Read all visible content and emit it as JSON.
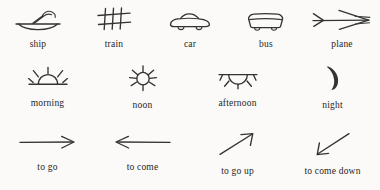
{
  "page": {
    "background_color": "#fbfaf8",
    "ink_color": "#333333"
  },
  "rows": [
    {
      "name": "transport",
      "items": [
        {
          "icon": "ship-icon",
          "label": "ship"
        },
        {
          "icon": "train-icon",
          "label": "train"
        },
        {
          "icon": "car-icon",
          "label": "car"
        },
        {
          "icon": "bus-icon",
          "label": "bus"
        },
        {
          "icon": "plane-icon",
          "label": "plane"
        }
      ]
    },
    {
      "name": "time-of-day",
      "items": [
        {
          "icon": "sunrise-icon",
          "label": "morning"
        },
        {
          "icon": "sun-icon",
          "label": "noon"
        },
        {
          "icon": "sunset-icon",
          "label": "afternoon"
        },
        {
          "icon": "crescent-moon-icon",
          "label": "night"
        }
      ]
    },
    {
      "name": "motion",
      "items": [
        {
          "icon": "arrow-right-icon",
          "label": "to go"
        },
        {
          "icon": "arrow-left-icon",
          "label": "to come"
        },
        {
          "icon": "arrow-up-right-icon",
          "label": "to go up"
        },
        {
          "icon": "arrow-down-left-icon",
          "label": "to come down"
        }
      ]
    }
  ]
}
